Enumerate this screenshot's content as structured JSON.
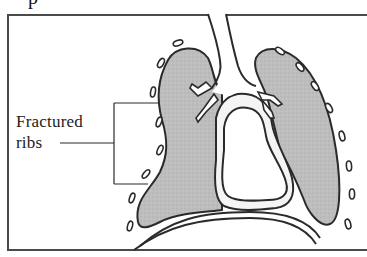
{
  "header": {
    "title_fragment": "p"
  },
  "figure": {
    "labels": {
      "fractured_ribs_line1": "Fractured",
      "fractured_ribs_line2": "ribs"
    },
    "colors": {
      "lung_fill": "#b9b9b9",
      "outline": "#2a2a2a",
      "frame": "#4a4a4a",
      "background": "#ffffff"
    },
    "parts": [
      "left-lung",
      "right-lung",
      "trachea",
      "bronchi",
      "heart",
      "diaphragm",
      "ribs"
    ]
  }
}
